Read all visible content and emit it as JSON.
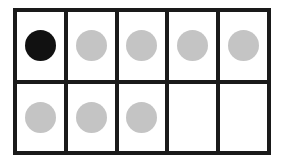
{
  "ten_frame": {
    "rows": 2,
    "columns": 5,
    "cells": [
      {
        "counter": "filled",
        "color": "#111111"
      },
      {
        "counter": "filled",
        "color": "#c4c4c4"
      },
      {
        "counter": "filled",
        "color": "#c4c4c4"
      },
      {
        "counter": "filled",
        "color": "#c4c4c4"
      },
      {
        "counter": "filled",
        "color": "#c4c4c4"
      },
      {
        "counter": "filled",
        "color": "#c4c4c4"
      },
      {
        "counter": "filled",
        "color": "#c4c4c4"
      },
      {
        "counter": "filled",
        "color": "#c4c4c4"
      },
      {
        "counter": "empty",
        "color": null
      },
      {
        "counter": "empty",
        "color": null
      }
    ],
    "counts": {
      "black": 1,
      "gray": 7,
      "empty": 2,
      "total_filled": 8
    },
    "colors": {
      "frame": "#1a1a1a",
      "black_counter": "#111111",
      "gray_counter": "#c4c4c4",
      "cell_background": "#ffffff"
    }
  }
}
